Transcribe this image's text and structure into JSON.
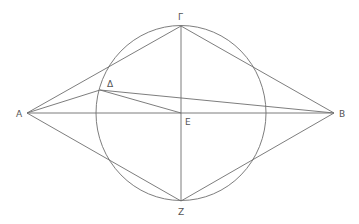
{
  "diagram": {
    "type": "geometric-construction",
    "points": [
      {
        "id": "A",
        "label": "A"
      },
      {
        "id": "B",
        "label": "B"
      },
      {
        "id": "G",
        "label": "Γ"
      },
      {
        "id": "D",
        "label": "Δ"
      },
      {
        "id": "E",
        "label": "E"
      },
      {
        "id": "Z",
        "label": "Z"
      }
    ],
    "circle": {
      "center": "E",
      "through": [
        "Γ",
        "Z"
      ]
    },
    "segments": [
      [
        "A",
        "Γ"
      ],
      [
        "A",
        "Δ"
      ],
      [
        "A",
        "B"
      ],
      [
        "A",
        "Z"
      ],
      [
        "Δ",
        "B"
      ],
      [
        "Δ",
        "E"
      ],
      [
        "Γ",
        "B"
      ],
      [
        "Γ",
        "Z"
      ],
      [
        "Z",
        "B"
      ]
    ],
    "colors": {
      "line": "#6e6e6e",
      "label": "#555555",
      "background": "#ffffff"
    }
  }
}
